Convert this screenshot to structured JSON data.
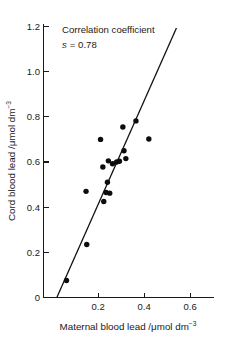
{
  "chart_data": {
    "type": "scatter",
    "title": "",
    "xlabel": "Maternal blood lead /μmol dm⁻³",
    "ylabel": "Cord blood lead /μmol dm⁻³",
    "xlabel_main": "Maternal blood lead /",
    "xlabel_unit": "μmol dm",
    "xlabel_exp": "−3",
    "ylabel_main": "Cord blood lead /",
    "ylabel_unit": "μmol dm",
    "ylabel_exp": "−3",
    "xlim": [
      0,
      0.68
    ],
    "ylim": [
      0,
      1.2
    ],
    "xticks": [
      0.2,
      0.4,
      0.6
    ],
    "xtick_labels": [
      "0.2",
      "0.4",
      "0.6"
    ],
    "yticks": [
      0,
      0.2,
      0.4,
      0.6,
      0.8,
      1.0,
      1.2
    ],
    "ytick_labels": [
      "0",
      "0.2",
      "0.4",
      "0.6",
      "0.8",
      "1.0",
      "1.2"
    ],
    "grid": false,
    "legend": false,
    "marker": "filled-circle",
    "marker_color": "#0d0d0d",
    "line_color": "#111111",
    "points": [
      {
        "x": 0.1,
        "y": 0.075
      },
      {
        "x": 0.188,
        "y": 0.235
      },
      {
        "x": 0.185,
        "y": 0.47
      },
      {
        "x": 0.248,
        "y": 0.7
      },
      {
        "x": 0.258,
        "y": 0.578
      },
      {
        "x": 0.262,
        "y": 0.425
      },
      {
        "x": 0.272,
        "y": 0.465
      },
      {
        "x": 0.278,
        "y": 0.51
      },
      {
        "x": 0.282,
        "y": 0.605
      },
      {
        "x": 0.288,
        "y": 0.462
      },
      {
        "x": 0.3,
        "y": 0.592
      },
      {
        "x": 0.318,
        "y": 0.6
      },
      {
        "x": 0.33,
        "y": 0.603
      },
      {
        "x": 0.345,
        "y": 0.755
      },
      {
        "x": 0.35,
        "y": 0.65
      },
      {
        "x": 0.358,
        "y": 0.615
      },
      {
        "x": 0.402,
        "y": 0.782
      },
      {
        "x": 0.458,
        "y": 0.702
      }
    ],
    "fit_line": {
      "x_start": 0.058,
      "y_start": 0.0,
      "x_end": 0.578,
      "y_end": 1.193
    },
    "annotations": [
      {
        "text": "Correlation coefficient",
        "x": 0.2,
        "y": 1.13
      },
      {
        "text": "s = 0.78",
        "x": 0.2,
        "y": 1.045,
        "symbol": "s",
        "value": "= 0.78"
      }
    ]
  },
  "annotation": {
    "line1": "Correlation coefficient",
    "symbol": "s",
    "equals_value": "= 0.78"
  }
}
